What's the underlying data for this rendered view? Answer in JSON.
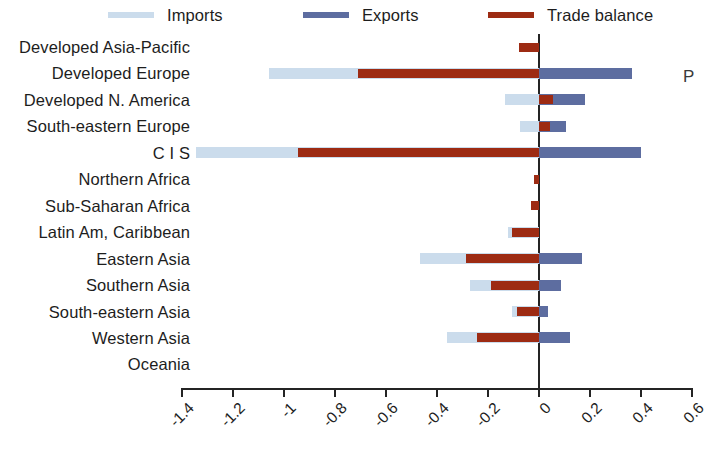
{
  "legend": {
    "items": [
      {
        "label": "Imports",
        "color": "#cbdcec"
      },
      {
        "label": "Exports",
        "color": "#5d6da0"
      },
      {
        "label": "Trade balance",
        "color": "#9d2b13"
      }
    ]
  },
  "edge_glyph": "P",
  "chart_data": {
    "type": "bar",
    "orientation": "horizontal",
    "title": "",
    "subtitle": "",
    "xlabel": "",
    "ylabel": "",
    "xlim": [
      -1.4,
      0.6
    ],
    "ylim": null,
    "grid": false,
    "legend_position": "top",
    "zero_line": 0,
    "xticks": [
      -1.4,
      -1.2,
      -1,
      -0.8,
      -0.6,
      -0.4,
      -0.2,
      0,
      0.2,
      0.4,
      0.6
    ],
    "xticklabels": [
      "-1.4",
      "-1.2",
      "-1",
      "-0.8",
      "-0.6",
      "-0.4",
      "-0.2",
      "0",
      "0.2",
      "0.4",
      "0.6"
    ],
    "categories": [
      "Developed Asia-Pacific",
      "Developed Europe",
      "Developed N. America",
      "South-eastern Europe",
      "C I S",
      "Northern Africa",
      "Sub-Saharan Africa",
      "Latin Am, Caribbean",
      "Eastern Asia",
      "Southern Asia",
      "South-eastern Asia",
      "Western Asia",
      "Oceania"
    ],
    "series": [
      {
        "name": "Imports",
        "color": "#cbdcec",
        "values": [
          0.0,
          -1.06,
          -0.135,
          -0.075,
          -1.345,
          0.0,
          0.0,
          -0.12,
          -0.465,
          -0.27,
          -0.105,
          -0.36,
          0.0
        ]
      },
      {
        "name": "Exports",
        "color": "#5d6da0",
        "values": [
          0.0,
          0.365,
          0.18,
          0.105,
          0.4,
          0.0,
          0.0,
          0.0,
          0.17,
          0.085,
          0.035,
          0.12,
          0.0
        ]
      },
      {
        "name": "Trade balance",
        "color": "#9d2b13",
        "values": [
          -0.08,
          -0.71,
          0.055,
          0.045,
          -0.945,
          -0.02,
          -0.03,
          -0.105,
          -0.285,
          -0.19,
          -0.085,
          -0.245,
          0.0
        ],
        "note": "drawn from 0 toward the value; small positive values for Developed N. America and South-eastern Europe"
      }
    ]
  }
}
